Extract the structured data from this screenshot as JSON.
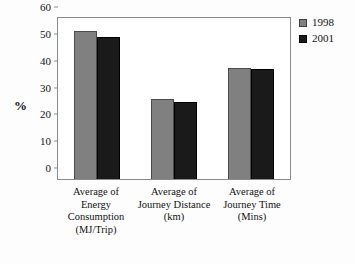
{
  "chart_data": {
    "type": "bar",
    "title": "",
    "xlabel": "",
    "ylabel": "%",
    "ylim": [
      0,
      60
    ],
    "yticks": [
      0,
      10,
      20,
      30,
      40,
      50,
      60
    ],
    "grid": false,
    "legend_position": "top-right-outside",
    "categories": [
      "Average of Energy Consumption (MJ/Trip)",
      "Average of Journey Distance (km)",
      "Average of Journey Time (Mins)"
    ],
    "category_lines": [
      [
        "Average of",
        "Energy",
        "Consumption",
        "(MJ/Trip)"
      ],
      [
        "Average of",
        "Journey Distance",
        "(km)"
      ],
      [
        "Average of",
        "Journey Time",
        "(Mins)"
      ]
    ],
    "series": [
      {
        "name": "1998",
        "color": "#808080",
        "values": [
          55,
          30,
          41.5
        ]
      },
      {
        "name": "2001",
        "color": "#1a1a1a",
        "values": [
          53,
          28.8,
          41
        ]
      }
    ]
  },
  "legend": {
    "items": [
      {
        "label": "1998"
      },
      {
        "label": "2001"
      }
    ]
  },
  "axis": {
    "y_label": "%",
    "y_ticks": [
      "60",
      "50",
      "40",
      "30",
      "20",
      "10",
      "0"
    ]
  }
}
